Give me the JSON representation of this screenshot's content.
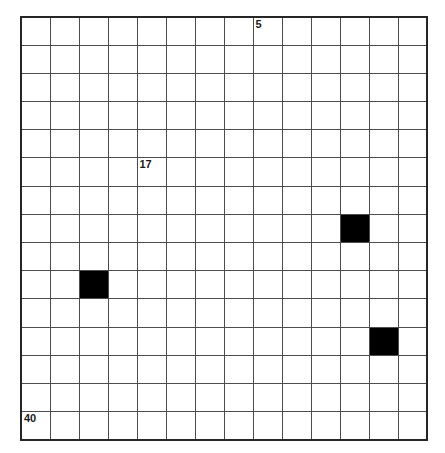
{
  "figure": {
    "background_color": "#ffffff",
    "grid_line_color": "#4d4d4d",
    "border_color": "#262626",
    "filled_cell_color": "#000000",
    "label_color": "#1a1a1a"
  },
  "chart_data": {
    "type": "heatmap",
    "title": "",
    "xlabel": "",
    "ylabel": "",
    "columns": 14,
    "rows": 15,
    "grid": true,
    "legend": "none",
    "cell_labels": [
      {
        "row": 0,
        "col": 8,
        "text": "5"
      },
      {
        "row": 5,
        "col": 4,
        "text": "17"
      },
      {
        "row": 14,
        "col": 0,
        "text": "40"
      }
    ],
    "filled_cells": [
      {
        "row": 7,
        "col": 11
      },
      {
        "row": 9,
        "col": 2
      },
      {
        "row": 11,
        "col": 12
      }
    ],
    "values": [
      [
        0,
        0,
        0,
        0,
        0,
        0,
        0,
        0,
        0,
        0,
        0,
        0,
        0,
        0
      ],
      [
        0,
        0,
        0,
        0,
        0,
        0,
        0,
        0,
        0,
        0,
        0,
        0,
        0,
        0
      ],
      [
        0,
        0,
        0,
        0,
        0,
        0,
        0,
        0,
        0,
        0,
        0,
        0,
        0,
        0
      ],
      [
        0,
        0,
        0,
        0,
        0,
        0,
        0,
        0,
        0,
        0,
        0,
        0,
        0,
        0
      ],
      [
        0,
        0,
        0,
        0,
        0,
        0,
        0,
        0,
        0,
        0,
        0,
        0,
        0,
        0
      ],
      [
        0,
        0,
        0,
        0,
        0,
        0,
        0,
        0,
        0,
        0,
        0,
        0,
        0,
        0
      ],
      [
        0,
        0,
        0,
        0,
        0,
        0,
        0,
        0,
        0,
        0,
        0,
        0,
        0,
        0
      ],
      [
        0,
        0,
        0,
        0,
        0,
        0,
        0,
        0,
        0,
        0,
        0,
        1,
        0,
        0
      ],
      [
        0,
        0,
        0,
        0,
        0,
        0,
        0,
        0,
        0,
        0,
        0,
        0,
        0,
        0
      ],
      [
        0,
        0,
        1,
        0,
        0,
        0,
        0,
        0,
        0,
        0,
        0,
        0,
        0,
        0
      ],
      [
        0,
        0,
        0,
        0,
        0,
        0,
        0,
        0,
        0,
        0,
        0,
        0,
        0,
        0
      ],
      [
        0,
        0,
        0,
        0,
        0,
        0,
        0,
        0,
        0,
        0,
        0,
        0,
        1,
        0
      ],
      [
        0,
        0,
        0,
        0,
        0,
        0,
        0,
        0,
        0,
        0,
        0,
        0,
        0,
        0
      ],
      [
        0,
        0,
        0,
        0,
        0,
        0,
        0,
        0,
        0,
        0,
        0,
        0,
        0,
        0
      ],
      [
        0,
        0,
        0,
        0,
        0,
        0,
        0,
        0,
        0,
        0,
        0,
        0,
        0,
        0
      ]
    ]
  }
}
